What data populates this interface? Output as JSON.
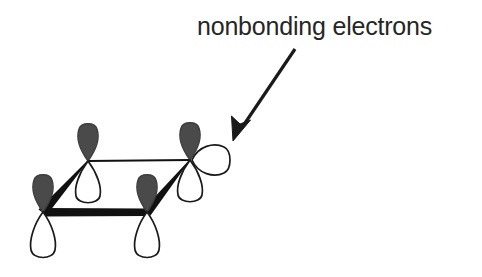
{
  "figure": {
    "kind": "molecular-orbital-diagram",
    "background_color": "#ffffff",
    "annotation": {
      "label": "nonbonding electrons",
      "text_color": "#262626",
      "font_size_px": 25,
      "position": {
        "x": 197,
        "y": 12
      }
    },
    "pointer_arrow": {
      "name": "annotation-arrow",
      "color": "#1a1a1a",
      "start": {
        "x": 295,
        "y": 49
      },
      "end": {
        "x": 233,
        "y": 141
      },
      "line_width_px": 3,
      "head_length_px": 22,
      "head_width_px": 13
    },
    "ring": {
      "name": "four-membered-ring",
      "vertices": [
        {
          "id": "top-left",
          "x": 88,
          "y": 161
        },
        {
          "id": "top-right",
          "x": 190,
          "y": 160
        },
        {
          "id": "bottom-right",
          "x": 147,
          "y": 212
        },
        {
          "id": "bottom-left",
          "x": 43,
          "y": 212
        }
      ],
      "edges": [
        {
          "id": "back-edge",
          "from": "top-left",
          "to": "top-right",
          "style": "thin-line",
          "width_px": 2.2
        },
        {
          "id": "right-edge",
          "from": "top-right",
          "to": "bottom-right",
          "style": "wedge",
          "width_px": 7
        },
        {
          "id": "front-edge",
          "from": "bottom-right",
          "to": "bottom-left",
          "style": "wedge",
          "width_px": 7
        },
        {
          "id": "left-edge",
          "from": "bottom-left",
          "to": "top-left",
          "style": "wedge",
          "width_px": 7
        }
      ],
      "edge_color": "#111111"
    },
    "orbitals": [
      {
        "id": "orbital-top-left",
        "center": {
          "x": 88,
          "y": 161
        },
        "upper_lobe": {
          "fill": "#4a4a4a",
          "height_px": 38,
          "width_px": 24
        },
        "lower_lobe": {
          "fill": "#ffffff",
          "height_px": 44,
          "width_px": 27
        }
      },
      {
        "id": "orbital-top-right",
        "center": {
          "x": 190,
          "y": 160
        },
        "upper_lobe": {
          "fill": "#4a4a4a",
          "height_px": 38,
          "width_px": 24
        },
        "lower_lobe": {
          "fill": "#ffffff",
          "height_px": 44,
          "width_px": 27
        }
      },
      {
        "id": "orbital-bottom-right",
        "center": {
          "x": 147,
          "y": 212
        },
        "upper_lobe": {
          "fill": "#4a4a4a",
          "height_px": 38,
          "width_px": 24
        },
        "lower_lobe": {
          "fill": "#ffffff",
          "height_px": 44,
          "width_px": 27
        }
      },
      {
        "id": "orbital-bottom-left",
        "center": {
          "x": 43,
          "y": 212
        },
        "upper_lobe": {
          "fill": "#4a4a4a",
          "height_px": 38,
          "width_px": 24
        },
        "lower_lobe": {
          "fill": "#ffffff",
          "height_px": 44,
          "width_px": 27
        }
      }
    ],
    "nonbonding_lobe": {
      "id": "nonbonding-orbital-lobe",
      "attached_to": "top-right",
      "direction": "right",
      "fill": "#ffffff",
      "stroke": "#1a1a1a",
      "tip": {
        "x": 192,
        "y": 160
      },
      "extent": {
        "x": 230,
        "y": 160
      },
      "width_px": 38,
      "height_px": 30
    },
    "stroke_color": "#1a1a1a",
    "lobe_stroke_width_px": 1.6
  }
}
